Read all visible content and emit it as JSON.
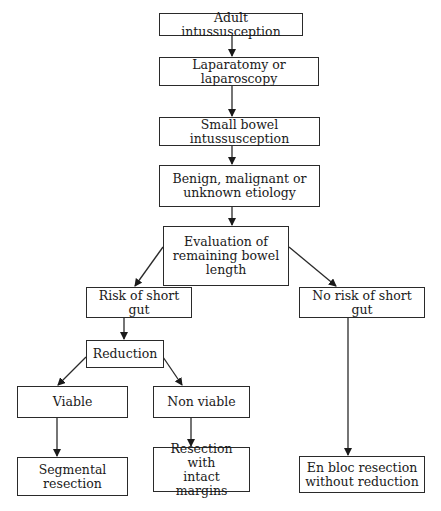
{
  "diagram": {
    "type": "flowchart",
    "nodes": [
      {
        "id": "adult_intussusception",
        "label": "Adult intussusception"
      },
      {
        "id": "laparatomy",
        "label": "Laparatomy or laparoscopy"
      },
      {
        "id": "small_bowel",
        "label": "Small bowel intussusception"
      },
      {
        "id": "etiology",
        "label": "Benign, malignant or\nunknown etiology"
      },
      {
        "id": "evaluation",
        "label": "Evaluation of\nremaining bowel\nlength"
      },
      {
        "id": "risk_short_gut",
        "label": "Risk of short gut"
      },
      {
        "id": "no_risk_short_gut",
        "label": "No risk of short gut"
      },
      {
        "id": "reduction",
        "label": "Reduction"
      },
      {
        "id": "viable",
        "label": "Viable"
      },
      {
        "id": "non_viable",
        "label": "Non viable"
      },
      {
        "id": "segmental_resection",
        "label": "Segmental\nresection"
      },
      {
        "id": "resection_intact",
        "label": "Resection with\nintact margins"
      },
      {
        "id": "en_bloc",
        "label": "En bloc resection\nwithout reduction"
      }
    ],
    "edges": [
      {
        "from": "adult_intussusception",
        "to": "laparatomy"
      },
      {
        "from": "laparatomy",
        "to": "small_bowel"
      },
      {
        "from": "small_bowel",
        "to": "etiology"
      },
      {
        "from": "etiology",
        "to": "evaluation"
      },
      {
        "from": "evaluation",
        "to": "risk_short_gut"
      },
      {
        "from": "evaluation",
        "to": "no_risk_short_gut"
      },
      {
        "from": "risk_short_gut",
        "to": "reduction"
      },
      {
        "from": "reduction",
        "to": "viable"
      },
      {
        "from": "reduction",
        "to": "non_viable"
      },
      {
        "from": "viable",
        "to": "segmental_resection"
      },
      {
        "from": "non_viable",
        "to": "resection_intact"
      },
      {
        "from": "no_risk_short_gut",
        "to": "en_bloc"
      }
    ],
    "colors": {
      "stroke": "#2a2a2a",
      "text": "#1a1a1a",
      "background": "#ffffff"
    }
  }
}
